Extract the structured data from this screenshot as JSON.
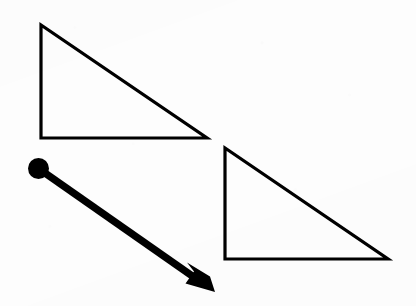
{
  "figure": {
    "kind": "geometry-translation-diagram",
    "caption": "",
    "width": 416,
    "height": 306,
    "background_color": "#fdfdfd",
    "ink_color": "#000000",
    "shapes": [
      {
        "name": "preimage-triangle",
        "role": "preimage",
        "type": "right-triangle",
        "label": "",
        "stroke_color": "#000000",
        "stroke_width": 3.2,
        "fill": "none",
        "points": "41,25 41,138 207,138",
        "vertices": [
          {
            "name": "apex",
            "x": 41,
            "y": 25
          },
          {
            "name": "right-angle",
            "x": 41,
            "y": 138
          },
          {
            "name": "base-right",
            "x": 207,
            "y": 138
          }
        ],
        "vertical_leg_length": 113,
        "horizontal_leg_length": 166
      },
      {
        "name": "image-triangle",
        "role": "image",
        "type": "right-triangle",
        "label": "",
        "stroke_color": "#000000",
        "stroke_width": 3.2,
        "fill": "none",
        "points": "225,148 225,259 388,259",
        "vertices": [
          {
            "name": "apex",
            "x": 225,
            "y": 148
          },
          {
            "name": "right-angle",
            "x": 225,
            "y": 259
          },
          {
            "name": "base-right",
            "x": 388,
            "y": 259
          }
        ],
        "vertical_leg_length": 111,
        "horizontal_leg_length": 163
      }
    ],
    "vector": {
      "name": "translation-vector",
      "label": "",
      "color": "#000000",
      "shaft_width": 7.5,
      "start": {
        "x": 38.5,
        "y": 168.5
      },
      "end": {
        "x": 215,
        "y": 292
      },
      "delta_x": 176,
      "delta_y": 124,
      "origin_dot": {
        "name": "vector-origin-dot",
        "cx": 38.5,
        "cy": 168.5,
        "r": 10.5,
        "color": "#000000"
      },
      "arrowhead": {
        "name": "vector-arrowhead",
        "style": "swallowtail",
        "tip": {
          "x": 215,
          "y": 292
        },
        "length": 30,
        "half_width": 15
      }
    }
  }
}
